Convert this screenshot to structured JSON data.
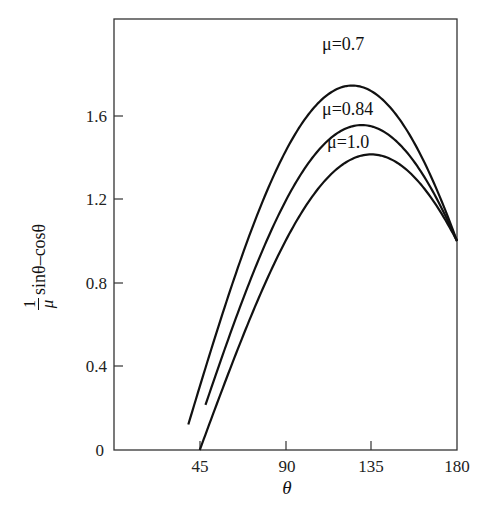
{
  "chart_data": {
    "type": "line",
    "title": "",
    "xlabel": "θ",
    "ylabel": "(1/μ) sinθ − cosθ",
    "ylabel_parts": {
      "numerator": "1",
      "denominator": "μ",
      "expression": "sinθ–cosθ"
    },
    "xlim": [
      0,
      180
    ],
    "ylim": [
      0,
      2.06
    ],
    "xticks": [
      45,
      90,
      135,
      180
    ],
    "xtick_labels": [
      "45",
      "90",
      "135",
      "180"
    ],
    "yticks": [
      0,
      0.4,
      0.8,
      1.2,
      1.6
    ],
    "ytick_labels": [
      "0",
      "0.4",
      "0.8",
      "1.2",
      "1.6"
    ],
    "grid": false,
    "legend": "inline labels near curve peaks",
    "series": [
      {
        "name": "μ=0.7",
        "mu": 0.7,
        "theta_start": 39,
        "theta_end": 180,
        "x": [
          39,
          60,
          90,
          110,
          125,
          140,
          160,
          180
        ],
        "values": [
          0.12,
          0.74,
          1.43,
          1.69,
          1.74,
          1.68,
          1.43,
          1.0
        ]
      },
      {
        "name": "μ=0.84",
        "mu": 0.84,
        "theta_start": 48,
        "theta_end": 180,
        "x": [
          48,
          60,
          90,
          110,
          130,
          150,
          180
        ],
        "values": [
          0.22,
          0.53,
          1.19,
          1.46,
          1.55,
          1.46,
          1.0
        ]
      },
      {
        "name": "μ=1.0",
        "mu": 1.0,
        "theta_start": 45,
        "theta_end": 180,
        "x": [
          45,
          60,
          90,
          115,
          135,
          155,
          180
        ],
        "values": [
          0.0,
          0.37,
          1.0,
          1.33,
          1.41,
          1.33,
          1.0
        ]
      }
    ]
  },
  "labels": {
    "mu07": "μ=0.7",
    "mu084": "μ=0.84",
    "mu10": "μ=1.0",
    "x_axis": "θ",
    "y_num": "1",
    "y_den": "μ",
    "y_expr": "sinθ–cosθ",
    "ticks": {
      "x45": "45",
      "x90": "90",
      "x135": "135",
      "x180": "180",
      "y0": "0",
      "y04": "0.4",
      "y08": "0.8",
      "y12": "1.2",
      "y16": "1.6"
    }
  }
}
